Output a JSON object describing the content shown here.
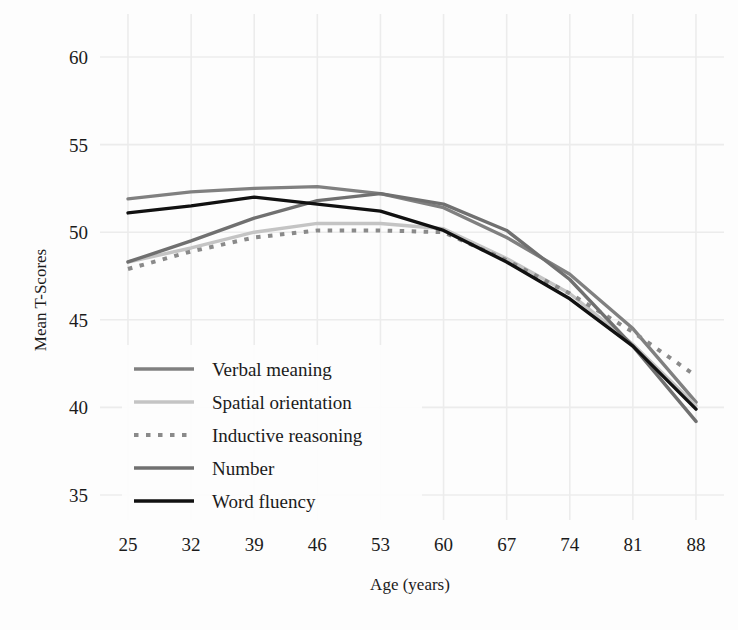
{
  "chart_data": {
    "type": "line",
    "title": "",
    "xlabel": "Age (years)",
    "ylabel": "Mean T-Scores",
    "x": [
      25,
      32,
      39,
      46,
      53,
      60,
      67,
      74,
      81,
      88
    ],
    "xtick_labels": [
      "25",
      "32",
      "39",
      "46",
      "53",
      "60",
      "67",
      "74",
      "81",
      "88"
    ],
    "ytick_labels": [
      "60",
      "55",
      "50",
      "45",
      "40",
      "35"
    ],
    "yticks": [
      60,
      55,
      50,
      45,
      40,
      35
    ],
    "xlim": [
      25,
      88
    ],
    "ylim": [
      33.5,
      61.5
    ],
    "grid": true,
    "legend_position": "lower-left-inside",
    "series": [
      {
        "name": "Verbal meaning",
        "color": "#808080",
        "style": "solid",
        "width": 3.4,
        "values": [
          51.9,
          52.3,
          52.5,
          52.6,
          52.2,
          51.4,
          49.7,
          47.6,
          44.5,
          40.3
        ]
      },
      {
        "name": "Spatial orientation",
        "color": "#c4c4c4",
        "style": "solid",
        "width": 3.4,
        "values": [
          48.3,
          49.1,
          50.0,
          50.5,
          50.5,
          50.2,
          48.5,
          46.5,
          43.6,
          40.1
        ]
      },
      {
        "name": "Inductive reasoning",
        "color": "#8a8a8a",
        "style": "dotted",
        "width": 4.0,
        "values": [
          47.9,
          48.9,
          49.7,
          50.1,
          50.1,
          50.0,
          48.4,
          46.5,
          44.3,
          41.8
        ]
      },
      {
        "name": "Number",
        "color": "#707070",
        "style": "solid",
        "width": 3.4,
        "values": [
          48.3,
          49.5,
          50.8,
          51.8,
          52.2,
          51.6,
          50.1,
          47.3,
          43.5,
          39.2
        ]
      },
      {
        "name": "Word fluency",
        "color": "#111111",
        "style": "solid",
        "width": 3.4,
        "values": [
          51.1,
          51.5,
          52.0,
          51.6,
          51.2,
          50.1,
          48.3,
          46.2,
          43.5,
          39.9
        ]
      }
    ]
  },
  "axes": {
    "y_axis_title": "Mean T-Scores",
    "x_axis_title": "Age (years)"
  },
  "legend": {
    "items": [
      {
        "label": "Verbal meaning"
      },
      {
        "label": "Spatial orientation"
      },
      {
        "label": "Inductive reasoning"
      },
      {
        "label": "Number"
      },
      {
        "label": "Word fluency"
      }
    ]
  }
}
